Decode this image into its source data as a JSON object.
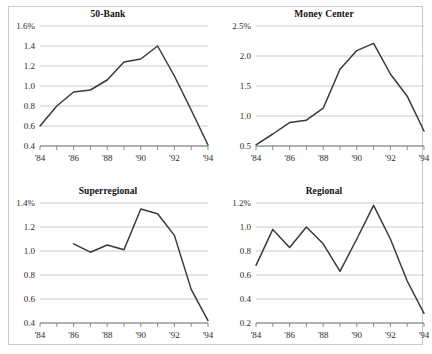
{
  "figure": {
    "background_color": "#ffffff",
    "border_color": "#c9c9c9",
    "line_color": "#3a3a3a",
    "gridline_color": "#bdbdbd",
    "axis_color": "#6f6f6f"
  },
  "chart_data": [
    {
      "type": "line",
      "title": "50-Bank",
      "xlabel": "",
      "ylabel": "",
      "grid": true,
      "legend": "none",
      "x": [
        1984,
        1985,
        1986,
        1987,
        1988,
        1989,
        1990,
        1991,
        1992,
        1993,
        1994
      ],
      "xtick_labels": [
        "'84",
        "'86",
        "'88",
        "'90",
        "'92",
        "'94"
      ],
      "xtick_values": [
        1984,
        1986,
        1988,
        1990,
        1992,
        1994
      ],
      "xlim": [
        1984,
        1994
      ],
      "ytick_labels": [
        "1.6%",
        "1.4",
        "1.2",
        "1.0",
        "0.8",
        "0.6",
        "0.4"
      ],
      "ytick_values": [
        1.6,
        1.4,
        1.2,
        1.0,
        0.8,
        0.6,
        0.4
      ],
      "ylim": [
        0.4,
        1.6
      ],
      "values": [
        0.6,
        0.8,
        0.94,
        0.96,
        1.06,
        1.24,
        1.27,
        1.4,
        1.1,
        0.76,
        0.41
      ]
    },
    {
      "type": "line",
      "title": "Money Center",
      "xlabel": "",
      "ylabel": "",
      "grid": true,
      "legend": "none",
      "x": [
        1984,
        1985,
        1986,
        1987,
        1988,
        1989,
        1990,
        1991,
        1992,
        1993,
        1994
      ],
      "xtick_labels": [
        "'84",
        "'86",
        "'88",
        "'90",
        "'92",
        "'94"
      ],
      "xtick_values": [
        1984,
        1986,
        1988,
        1990,
        1992,
        1994
      ],
      "xlim": [
        1984,
        1994
      ],
      "ytick_labels": [
        "2.5%",
        "2.0",
        "1.5",
        "1.0",
        "0.5"
      ],
      "ytick_values": [
        2.5,
        2.0,
        1.5,
        1.0,
        0.5
      ],
      "ylim": [
        0.5,
        2.5
      ],
      "values": [
        0.52,
        0.7,
        0.89,
        0.93,
        1.13,
        1.78,
        2.09,
        2.21,
        1.7,
        1.33,
        0.75
      ]
    },
    {
      "type": "line",
      "title": "Superregional",
      "xlabel": "",
      "ylabel": "",
      "grid": true,
      "legend": "none",
      "x": [
        1986,
        1987,
        1988,
        1989,
        1990,
        1991,
        1992,
        1993,
        1994
      ],
      "xtick_labels": [
        "'84",
        "'86",
        "'88",
        "'90",
        "'92",
        "'94"
      ],
      "xtick_values": [
        1984,
        1986,
        1988,
        1990,
        1992,
        1994
      ],
      "xlim": [
        1984,
        1994
      ],
      "ytick_labels": [
        "1.4%",
        "1.2",
        "1.0",
        "0.8",
        "0.6",
        "0.4"
      ],
      "ytick_values": [
        1.4,
        1.2,
        1.0,
        0.8,
        0.6,
        0.4
      ],
      "ylim": [
        0.4,
        1.4
      ],
      "values": [
        1.06,
        0.99,
        1.05,
        1.01,
        1.35,
        1.31,
        1.13,
        0.68,
        0.42
      ]
    },
    {
      "type": "line",
      "title": "Regional",
      "xlabel": "",
      "ylabel": "",
      "grid": true,
      "legend": "none",
      "x": [
        1984,
        1985,
        1986,
        1987,
        1988,
        1989,
        1990,
        1991,
        1992,
        1993,
        1994
      ],
      "xtick_labels": [
        "'84",
        "'86",
        "'88",
        "'90",
        "'92",
        "'94"
      ],
      "xtick_values": [
        1984,
        1986,
        1988,
        1990,
        1992,
        1994
      ],
      "xlim": [
        1984,
        1994
      ],
      "ytick_labels": [
        "1.2%",
        "1.0",
        "0.8",
        "0.6",
        "0.4",
        "0.2"
      ],
      "ytick_values": [
        1.2,
        1.0,
        0.8,
        0.6,
        0.4,
        0.2
      ],
      "ylim": [
        0.2,
        1.2
      ],
      "values": [
        0.68,
        0.98,
        0.83,
        1.0,
        0.86,
        0.63,
        0.9,
        1.18,
        0.9,
        0.55,
        0.28
      ]
    }
  ]
}
